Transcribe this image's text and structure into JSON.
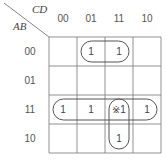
{
  "row_variable": "AB",
  "col_variable": "CD",
  "col_labels": [
    "00",
    "01",
    "11",
    "10"
  ],
  "row_labels": [
    "00",
    "01",
    "11",
    "10"
  ],
  "cells": [
    [
      "",
      "1",
      "1",
      ""
    ],
    [
      "",
      "",
      "",
      ""
    ],
    [
      "1",
      "1",
      "※1",
      "1"
    ],
    [
      "",
      "",
      "1",
      ""
    ]
  ],
  "groups": [
    {
      "name": "group-row00-cols01-11",
      "row_start": 0,
      "row_end": 0,
      "col_start": 1,
      "col_end": 2
    },
    {
      "name": "group-row11-all",
      "row_start": 2,
      "row_end": 2,
      "col_start": 0,
      "col_end": 3
    },
    {
      "name": "group-col11-rows11-10",
      "row_start": 2,
      "row_end": 3,
      "col_start": 2,
      "col_end": 2
    }
  ]
}
